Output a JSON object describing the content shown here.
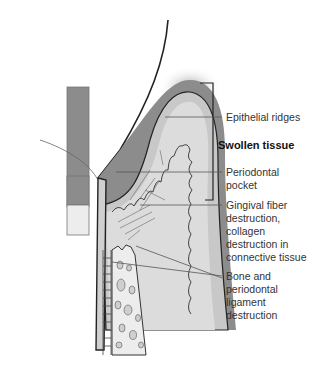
{
  "diagram": {
    "type": "anatomical cross-section (periodontal disease)",
    "labels": {
      "epithelial_ridges": "Epithelial ridges",
      "swollen_tissue": "Swollen tissue",
      "periodontal_pocket": "Periodontal\npocket",
      "gingival_fiber": "Gingival fiber\ndestruction,\ncollagen\ndestruction in\nconnective tissue",
      "bone_ligament": "Bone and\nperiodontal\nligament\ndestruction"
    },
    "colors": {
      "gum_dark": "#8c8c8c",
      "gum_light": "#c8c8c8",
      "connective": "#dcdcdc",
      "bone": "#ededed",
      "outline": "#222222",
      "leader": "#555555"
    }
  }
}
